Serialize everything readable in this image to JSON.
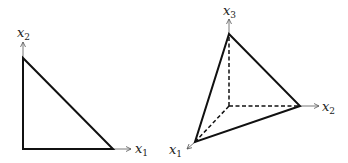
{
  "figure": {
    "left_panel": {
      "title": "2D simplex (triangle)",
      "axes": [
        {
          "name": "x",
          "sub": "1",
          "direction": "horizontal"
        },
        {
          "name": "x",
          "sub": "2",
          "direction": "vertical"
        }
      ],
      "vertices": {
        "origin": [
          23,
          149
        ],
        "x1_vertex": [
          113,
          149
        ],
        "x2_vertex": [
          23,
          58
        ]
      },
      "edge_style": "solid"
    },
    "right_panel": {
      "title": "3D simplex (tetrahedron)",
      "axes": [
        {
          "name": "x",
          "sub": "1",
          "direction": "oblique"
        },
        {
          "name": "x",
          "sub": "2",
          "direction": "horizontal"
        },
        {
          "name": "x",
          "sub": "3",
          "direction": "vertical"
        }
      ],
      "vertices": {
        "origin": [
          229,
          106
        ],
        "x1_vertex": [
          195,
          142
        ],
        "x2_vertex": [
          300,
          106
        ],
        "x3_vertex": [
          229,
          34
        ]
      },
      "solid_edges": [
        "x1-x2",
        "x2-x3",
        "x3-x1"
      ],
      "dashed_edges": [
        "origin-x1",
        "origin-x2",
        "origin-x3"
      ]
    },
    "colors": {
      "line": "#111111",
      "axis": "#555555",
      "background": "#ffffff"
    }
  }
}
